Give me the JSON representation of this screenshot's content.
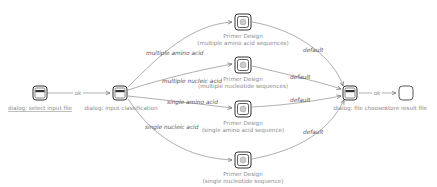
{
  "nodes": {
    "select_input": {
      "label": "dialog: select input file",
      "type": "dialog"
    },
    "input_class": {
      "label": "dialog: input classification",
      "type": "dialog"
    },
    "pd_multi_aa": {
      "label1": "Primer Design",
      "label2": "(multiple amino acid sequences)",
      "type": "service"
    },
    "pd_multi_nt": {
      "label1": "Primer Design",
      "label2": "(multiple nucleotide sequences)",
      "type": "service"
    },
    "pd_single_aa": {
      "label1": "Primer Design",
      "label2": "(single amino acid sequence)",
      "type": "service"
    },
    "pd_single_nt": {
      "label1": "Primer Design",
      "label2": "(single nucleotide sequence)",
      "type": "service"
    },
    "file_chooser": {
      "label": "dialog: file chooser",
      "type": "dialog"
    },
    "store_result": {
      "label": "store result file",
      "type": "end"
    }
  },
  "edges": {
    "e1": "ok",
    "e2": "multiple amino acid",
    "e3": "multiple nucleic acid",
    "e4": "single amino acid",
    "e5": "single nucleic acid",
    "e6": "default",
    "e7": "default",
    "e8": "default",
    "e9": "default",
    "e10": "ok"
  }
}
